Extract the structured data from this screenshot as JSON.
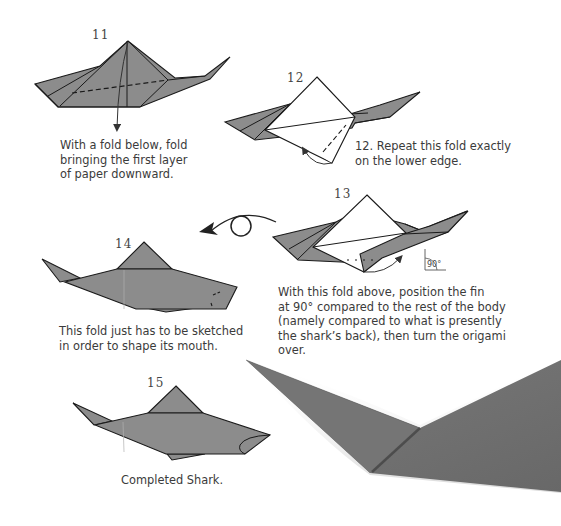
{
  "page": {
    "colors": {
      "paper_grey": "#8c8c8c",
      "paper_white": "#ffffff",
      "line": "#1a1a1a",
      "photo_grey": "#6e6e6e",
      "text": "#3b3b3b"
    },
    "steps": [
      {
        "number": "11",
        "caption": "With a fold below, fold\nbringing the first layer\nof paper downward."
      },
      {
        "number": "12",
        "caption": "12. Repeat this fold exactly\non the lower edge."
      },
      {
        "number": "13",
        "caption": "With this fold above, position the fin\nat 90° compared to the rest of the body\n(namely compared to what is presently\nthe shark’s back), then turn the origami\nover.",
        "angle_label": "90°"
      },
      {
        "number": "14",
        "caption": "This fold just has to be sketched\nin order to shape its mouth."
      },
      {
        "number": "15",
        "caption": "Completed Shark."
      }
    ],
    "icons": {
      "turn_over": "turn-over-arrow",
      "fold_arrow": "fold-arrow",
      "right_angle": "right-angle-marker"
    }
  }
}
